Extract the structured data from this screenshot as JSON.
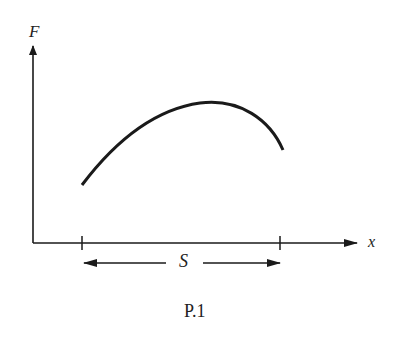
{
  "figure": {
    "y_axis_label": "F",
    "x_axis_label": "x",
    "span_label": "S",
    "caption": "P.1",
    "curve_description": "Force F as a function of position x over a span S; rises from left tick to a maximum then decreases toward the right tick",
    "colors": {
      "ink": "#1a1a1a",
      "background": "#ffffff"
    }
  }
}
